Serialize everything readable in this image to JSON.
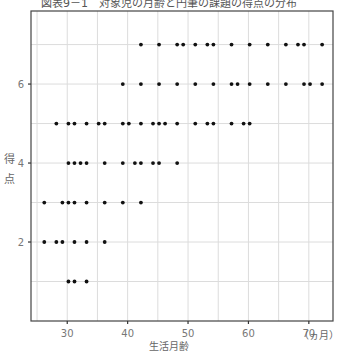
{
  "chart_data": {
    "type": "scatter",
    "title": "図表9－1　対象児の月齢と円筆の課題の得点の分布",
    "xlabel": "生活月齢",
    "xunit": "（ヵ月）",
    "ylabel": "得点",
    "xlim": [
      24,
      74
    ],
    "ylim": [
      0,
      7.85
    ],
    "xticks": [
      30,
      40,
      50,
      60,
      70
    ],
    "yticks": [
      2,
      4,
      6
    ],
    "x_grid_step": 5,
    "y_grid_step": 1,
    "grid": true,
    "legend": null,
    "series": [
      {
        "name": "score 7",
        "y": 7,
        "x": [
          42,
          45,
          48,
          49,
          51,
          53,
          54,
          57,
          60,
          63,
          66,
          68,
          69,
          72
        ]
      },
      {
        "name": "score 6",
        "y": 6,
        "x": [
          39,
          42,
          45,
          48,
          51,
          54,
          57,
          58,
          60,
          63,
          66,
          69,
          70,
          72
        ]
      },
      {
        "name": "score 5",
        "y": 5,
        "x": [
          28,
          30,
          31,
          33,
          35,
          36,
          39,
          40,
          42,
          44,
          45,
          46,
          48,
          51,
          53,
          54,
          57,
          59,
          60
        ]
      },
      {
        "name": "score 4",
        "y": 4,
        "x": [
          30,
          31,
          32,
          33,
          36,
          39,
          41,
          42,
          44,
          45,
          48
        ]
      },
      {
        "name": "score 3",
        "y": 3,
        "x": [
          26,
          29,
          30,
          31,
          33,
          36,
          39,
          42
        ]
      },
      {
        "name": "score 2",
        "y": 2,
        "x": [
          26,
          28,
          29,
          31,
          33,
          36
        ]
      },
      {
        "name": "score 1",
        "y": 1,
        "x": [
          30,
          31,
          33
        ]
      }
    ]
  }
}
